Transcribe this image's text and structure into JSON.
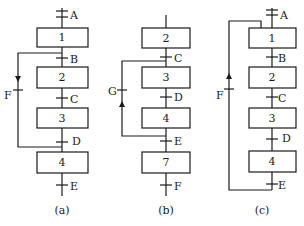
{
  "diagrams": {
    "a": {
      "caption": "(a)",
      "top_label": "A",
      "steps": [
        "1",
        "2",
        "3",
        "4"
      ],
      "transitions": [
        "B",
        "C",
        "D",
        "E"
      ],
      "loop_transition": "F",
      "loop_direction": "down (skip from after step 1 to before step 4)"
    },
    "b": {
      "caption": "(b)",
      "steps": [
        "2",
        "3",
        "4",
        "7"
      ],
      "transitions": [
        "C",
        "D",
        "E",
        "F"
      ],
      "loop_transition": "G",
      "loop_direction": "up (jump back from after step 4 to step 3)"
    },
    "c": {
      "caption": "(c)",
      "top_label": "A",
      "steps": [
        "1",
        "2",
        "3",
        "4"
      ],
      "transitions": [
        "B",
        "C",
        "D",
        "E"
      ],
      "loop_transition": "F",
      "loop_direction": "up (return from end to step 1)"
    }
  },
  "colors": {
    "line": "#1a1a1a",
    "background": "#ffffff"
  }
}
